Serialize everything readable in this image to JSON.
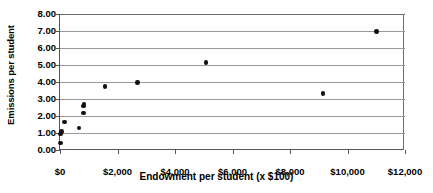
{
  "chart_data": {
    "type": "scatter",
    "title": "",
    "xlabel": "Endowment per student (x $100)",
    "ylabel": "Emissions per student",
    "xlim": [
      0,
      12000
    ],
    "ylim": [
      0,
      8
    ],
    "grid": true,
    "legend": "none",
    "x_tick_labels": [
      "$0",
      "$2,000",
      "$4,000",
      "$6,000",
      "$8,000",
      "$10,000",
      "$12,000"
    ],
    "x_tick_values": [
      0,
      2000,
      4000,
      6000,
      8000,
      10000,
      12000
    ],
    "y_tick_labels": [
      "0.00",
      "1.00",
      "2.00",
      "3.00",
      "4.00",
      "5.00",
      "6.00",
      "7.00",
      "8.00"
    ],
    "y_tick_values": [
      0,
      1,
      2,
      3,
      4,
      5,
      6,
      7,
      8
    ],
    "marker": "filled-circle",
    "marker_color": "#111111",
    "points": [
      {
        "x": 20,
        "y": 0.42
      },
      {
        "x": 20,
        "y": 0.95
      },
      {
        "x": 40,
        "y": 1.05
      },
      {
        "x": 60,
        "y": 1.08
      },
      {
        "x": 160,
        "y": 1.65
      },
      {
        "x": 660,
        "y": 1.3
      },
      {
        "x": 810,
        "y": 2.18
      },
      {
        "x": 820,
        "y": 2.58
      },
      {
        "x": 830,
        "y": 2.7
      },
      {
        "x": 1560,
        "y": 3.75
      },
      {
        "x": 2700,
        "y": 3.97
      },
      {
        "x": 5080,
        "y": 5.15
      },
      {
        "x": 9150,
        "y": 3.33
      },
      {
        "x": 11000,
        "y": 6.97
      }
    ]
  }
}
